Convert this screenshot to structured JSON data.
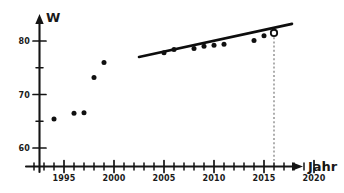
{
  "chart_data": {
    "type": "scatter",
    "title": "",
    "xlabel": "Jahr",
    "ylabel": "W",
    "xlim": [
      1992,
      2021
    ],
    "ylim": [
      57,
      84
    ],
    "grid": false,
    "legend": null,
    "x_ticks_major": [
      1995,
      2000,
      2005,
      2010,
      2015,
      2020
    ],
    "x_tick_labels": [
      "1995",
      "2000",
      "2005",
      "2010",
      "2015",
      "2020"
    ],
    "x_minor_tick_step": 1,
    "y_ticks_major": [
      60,
      70,
      80
    ],
    "y_tick_labels": [
      "60",
      "70",
      "80"
    ],
    "y_minor_ticks": [
      65,
      75
    ],
    "series": [
      {
        "name": "Messwerte",
        "marker": "filled-dot",
        "points": [
          {
            "x": 1994,
            "y": 65.4
          },
          {
            "x": 1996,
            "y": 66.5
          },
          {
            "x": 1997,
            "y": 66.6
          },
          {
            "x": 1998,
            "y": 73.2
          },
          {
            "x": 1999,
            "y": 76.0
          },
          {
            "x": 2005,
            "y": 77.8
          },
          {
            "x": 2006,
            "y": 78.4
          },
          {
            "x": 2008,
            "y": 78.6
          },
          {
            "x": 2009,
            "y": 79.0
          },
          {
            "x": 2010,
            "y": 79.2
          },
          {
            "x": 2011,
            "y": 79.4
          },
          {
            "x": 2014,
            "y": 80.1
          },
          {
            "x": 2015,
            "y": 81.0
          }
        ]
      },
      {
        "name": "Prognosepunkt",
        "marker": "open-circle",
        "points": [
          {
            "x": 2016,
            "y": 81.5
          }
        ]
      }
    ],
    "trend_line": {
      "name": "Ausgleichsgerade",
      "x_start": 2002.5,
      "y_start": 77.0,
      "x_end": 2017.8,
      "y_end": 83.2
    },
    "annotations": [
      {
        "name": "projection-dropline",
        "type": "dashed-vertical",
        "x": 2016,
        "y_from": 81.5,
        "y_to": 57.6
      }
    ]
  },
  "axes": {
    "y_axis_label": "W",
    "x_axis_label": "Jahr"
  }
}
